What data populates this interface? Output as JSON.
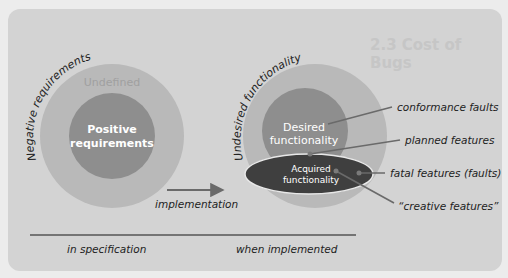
{
  "diagram": {
    "left_group": {
      "arc_label": "Negative requirements",
      "outer_label": "Undefined",
      "inner_label_line1": "Positive",
      "inner_label_line2": "requirements"
    },
    "right_group": {
      "arc_label": "Undesired functionality",
      "inner_label_line1": "Desired",
      "inner_label_line2": "functionality",
      "ellipse_label_line1": "Acquired",
      "ellipse_label_line2": "functionality"
    },
    "arrow_label": "implementation",
    "callouts": [
      {
        "label": "conformance faults"
      },
      {
        "label": "planned features"
      },
      {
        "label": "fatal features (faults)"
      },
      {
        "label": "“creative features”"
      }
    ],
    "footer": {
      "left": "in specification",
      "right": "when implemented"
    },
    "colors": {
      "panel": "#d3d3d3",
      "outer_circle": "#b9b9b9",
      "inner_circle": "#8e8e8e",
      "ellipse": "#3f3f3f",
      "line": "#6a6a6a",
      "text_dark": "#222222",
      "text_light": "#ffffff"
    }
  },
  "background": {
    "heading": "2.3 Cost of Bugs"
  }
}
